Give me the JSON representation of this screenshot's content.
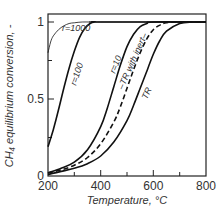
{
  "chart_data": {
    "type": "line",
    "title": "",
    "xlabel": "Temperature, °C",
    "ylabel": "CH₄ equilibrium conversion, -",
    "xlim": [
      200,
      800
    ],
    "ylim": [
      0,
      1.05
    ],
    "xticks": [
      200,
      400,
      600,
      800
    ],
    "xticks_minor": [
      300,
      500,
      700
    ],
    "yticks": [
      0,
      0.5,
      1
    ],
    "yticks_minor": [
      0.25,
      0.75
    ],
    "xtick_labels": [
      "200",
      "400",
      "600",
      "800"
    ],
    "ytick_labels": [
      "0",
      "0.5",
      "1"
    ],
    "grid": false,
    "legend": "inline curve labels",
    "series": [
      {
        "name": "r=1000",
        "style": "solid-thin",
        "x": [
          200,
          210,
          220,
          240,
          260,
          280,
          300,
          330,
          360,
          400,
          800
        ],
        "y": [
          0.8,
          0.87,
          0.91,
          0.95,
          0.975,
          0.99,
          0.995,
          1.0,
          1.0,
          1.0,
          1.0
        ]
      },
      {
        "name": "r=100",
        "style": "solid",
        "x": [
          200,
          220,
          240,
          260,
          280,
          300,
          320,
          340,
          360,
          380,
          400,
          800
        ],
        "y": [
          0.19,
          0.3,
          0.43,
          0.57,
          0.7,
          0.81,
          0.9,
          0.96,
          0.99,
          1.0,
          1.0,
          1.0
        ]
      },
      {
        "name": "r=10",
        "style": "solid",
        "x": [
          200,
          250,
          300,
          350,
          400,
          425,
          450,
          475,
          500,
          525,
          550,
          575,
          600,
          800
        ],
        "y": [
          0.02,
          0.05,
          0.09,
          0.17,
          0.32,
          0.44,
          0.58,
          0.72,
          0.84,
          0.92,
          0.97,
          0.99,
          1.0,
          1.0
        ]
      },
      {
        "name": "TR with inert",
        "style": "dashed",
        "x": [
          200,
          250,
          300,
          350,
          400,
          450,
          475,
          500,
          525,
          550,
          575,
          600,
          625,
          650,
          700,
          800
        ],
        "y": [
          0.02,
          0.04,
          0.07,
          0.12,
          0.21,
          0.35,
          0.45,
          0.57,
          0.69,
          0.8,
          0.89,
          0.95,
          0.98,
          0.995,
          1.0,
          1.0
        ]
      },
      {
        "name": "TR",
        "style": "solid",
        "x": [
          200,
          250,
          300,
          350,
          400,
          450,
          500,
          525,
          550,
          575,
          600,
          625,
          650,
          700,
          750,
          800
        ],
        "y": [
          0.01,
          0.03,
          0.05,
          0.08,
          0.13,
          0.22,
          0.36,
          0.46,
          0.57,
          0.68,
          0.79,
          0.88,
          0.94,
          0.99,
          1.0,
          1.0
        ]
      }
    ]
  },
  "labels": {
    "r1000": "r=1000",
    "r100": "r=100",
    "r10": "r=10",
    "tr_inert": "–TR with inert–",
    "tr": "TR"
  },
  "axes": {
    "x_label": "Temperature, °C",
    "y_label": "CH₄ equilibrium conversion, -",
    "x_ticks": [
      "200",
      "400",
      "600",
      "800"
    ],
    "y_ticks": [
      "0",
      "0.5",
      "1"
    ]
  }
}
